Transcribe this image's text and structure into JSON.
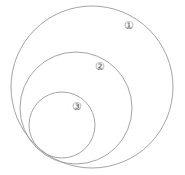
{
  "diagram": {
    "type": "nested tangent circles",
    "circles": [
      {
        "id": 1,
        "label": "①",
        "cx": 92,
        "cy": 87,
        "r": 81,
        "label_x": 129,
        "label_y": 28
      },
      {
        "id": 2,
        "label": "②",
        "cx": 76,
        "cy": 108,
        "r": 56,
        "label_x": 100,
        "label_y": 70
      },
      {
        "id": 3,
        "label": "③",
        "cx": 62,
        "cy": 125,
        "r": 33,
        "label_x": 77,
        "label_y": 110
      }
    ],
    "stroke_color": "#9a9a9a",
    "background": "#ffffff"
  }
}
